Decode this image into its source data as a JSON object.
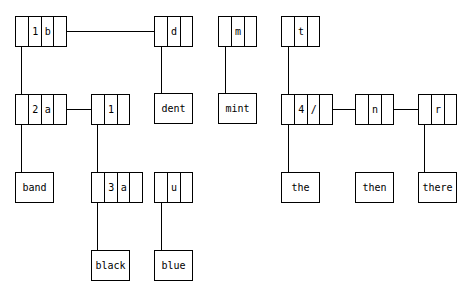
{
  "diagram": {
    "type": "trie",
    "nodes": [
      {
        "id": "n1b",
        "cells": [
          "",
          "1",
          "b",
          ""
        ]
      },
      {
        "id": "nd",
        "cells": [
          "",
          "d",
          ""
        ]
      },
      {
        "id": "nm",
        "cells": [
          "",
          "m",
          ""
        ]
      },
      {
        "id": "nt",
        "cells": [
          "",
          "t",
          ""
        ]
      },
      {
        "id": "n2a",
        "cells": [
          "",
          "2",
          "a",
          ""
        ]
      },
      {
        "id": "n1",
        "cells": [
          "",
          "1",
          ""
        ]
      },
      {
        "id": "n4",
        "cells": [
          "",
          "4",
          "/",
          ""
        ]
      },
      {
        "id": "nn",
        "cells": [
          "",
          "n",
          ""
        ]
      },
      {
        "id": "nr",
        "cells": [
          "",
          "r",
          ""
        ]
      },
      {
        "id": "n3a",
        "cells": [
          "",
          "3",
          "a",
          ""
        ]
      },
      {
        "id": "nu",
        "cells": [
          "",
          "u",
          ""
        ]
      }
    ],
    "leaves": {
      "dent": "dent",
      "mint": "mint",
      "band": "band",
      "the": "the",
      "then": "then",
      "there": "there",
      "black": "black",
      "blue": "blue"
    }
  }
}
